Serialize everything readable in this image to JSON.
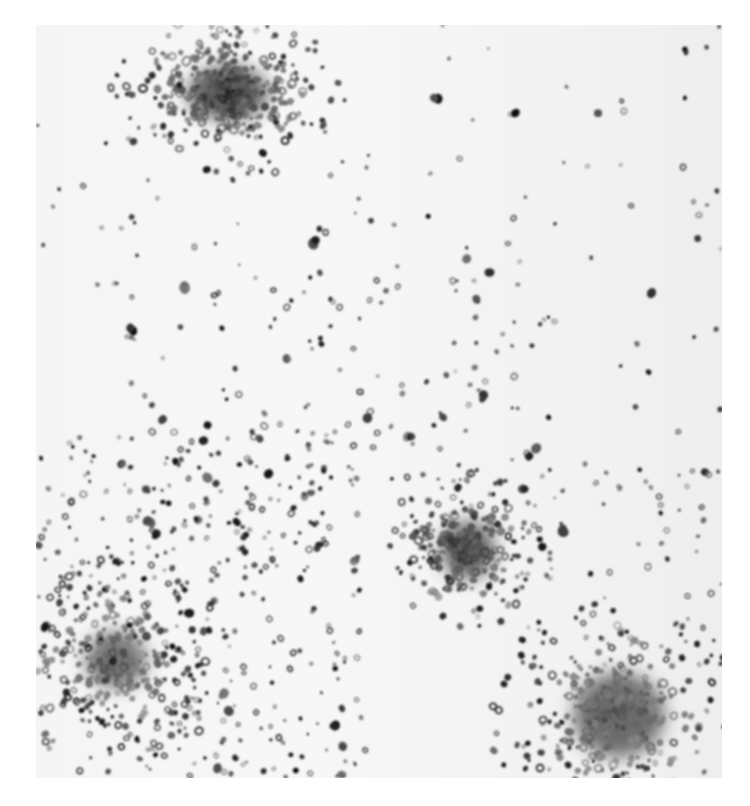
{
  "image": {
    "description": "Grayscale light micrograph of cell colonies on a plate",
    "frame": {
      "x": 36,
      "y": 25,
      "width": 686,
      "height": 753
    },
    "colors": {
      "page_background": "#ffffff",
      "plate_background": "#f4f4f4",
      "cell_dark": "#1a1a1a",
      "cell_mid": "#4a4a4a",
      "cell_light": "#8a8a8a"
    },
    "colonies": [
      {
        "name": "colony-top-left",
        "cx": 192,
        "cy": 68,
        "rx": 62,
        "ry": 46,
        "core_rx": 40,
        "core_ry": 26,
        "density": 260,
        "halo": 110,
        "darkness": 0.92
      },
      {
        "name": "colony-center-right",
        "cx": 432,
        "cy": 525,
        "rx": 44,
        "ry": 42,
        "core_rx": 26,
        "core_ry": 28,
        "density": 160,
        "halo": 80,
        "darkness": 0.9
      },
      {
        "name": "colony-bottom-right",
        "cx": 583,
        "cy": 690,
        "rx": 70,
        "ry": 62,
        "core_rx": 45,
        "core_ry": 42,
        "density": 220,
        "halo": 120,
        "darkness": 0.8
      },
      {
        "name": "colony-bottom-left",
        "cx": 80,
        "cy": 635,
        "rx": 60,
        "ry": 55,
        "core_rx": 30,
        "core_ry": 28,
        "density": 150,
        "halo": 140,
        "darkness": 0.75
      }
    ],
    "scatter_regions": [
      {
        "name": "scatter-lower-left-field",
        "x": 0,
        "y": 400,
        "width": 330,
        "height": 353,
        "count": 320
      },
      {
        "name": "scatter-middle-field",
        "x": 80,
        "y": 250,
        "width": 450,
        "height": 300,
        "count": 170
      },
      {
        "name": "scatter-upper-right-field",
        "x": 380,
        "y": 0,
        "width": 306,
        "height": 480,
        "count": 60
      },
      {
        "name": "scatter-upper-field",
        "x": 0,
        "y": 100,
        "width": 400,
        "height": 200,
        "count": 40
      },
      {
        "name": "scatter-right-band",
        "x": 480,
        "y": 440,
        "width": 206,
        "height": 200,
        "count": 60
      }
    ],
    "seed": 1337
  }
}
